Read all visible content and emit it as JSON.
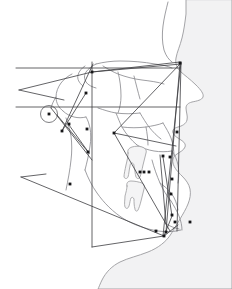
{
  "image": {
    "title": "Lateral Cephalometric Tracing",
    "description": "Cephalometric radiograph tracing of a lateral skull profile with superimposed analysis lines and landmark points",
    "width": 232,
    "height": 289,
    "background_color": "#ffffff"
  },
  "colors": {
    "background": "#ffffff",
    "soft_tissue_fill": "#f2f2f3",
    "soft_tissue_stroke": "#9b9b9e",
    "bone_stroke": "#8d8d91",
    "bone_fill": "#ededef",
    "tooth_fill": "#f4f4f5",
    "tooth_stroke": "#9a9a9d",
    "analysis_line": "#3c3c40",
    "landmark_dot": "#161618"
  },
  "structures": {
    "soft_tissue_profile": {
      "name": "soft-tissue-profile",
      "path": "M 186 0 L 186 14 C 185 22 184 30 182 38 C 180 46 177 52 176 58 C 175 64 177 68 180 71 C 184 75 190 79 196 85 C 201 90 204 94 203 97 C 202 100 197 101 192 102 C 188 103 186 105 186 108 C 186 112 188 116 187 120 C 186 124 182 126 178 127 C 174 128 172 130 173 133 C 174 136 178 138 181 140 C 184 142 186 144 185 147 C 184 150 180 152 177 154 C 174 156 172 159 173 163 C 174 168 178 172 182 176 C 186 180 189 184 190 189 C 191 194 190 199 188 204 C 186 209 183 214 180 219 C 177 224 174 229 171 234 C 166 242 158 248 148 252 C 138 256 128 258 120 262 C 112 266 106 272 102 280 C 100 284 99 287 98 289 L 232 289 L 232 0 Z"
    },
    "cranial_outline": {
      "name": "cranial-base-outline",
      "paths": [
        "M 168 2 C 166 10 164 18 163 26 C 162 34 162 42 164 50 C 166 56 169 60 172 62",
        "M 96 64 C 104 62 112 61 120 61 C 132 61 144 62 155 64 C 162 65 168 66 172 68",
        "M 96 64 C 92 66 88 69 86 72 C 84 75 84 79 86 82 C 88 85 92 87 96 88",
        "M 85 66 C 82 68 79 71 78 75 C 77 79 79 83 83 86",
        "M 103 66 C 108 69 113 72 118 74 C 126 77 134 79 142 80 C 150 81 158 82 164 84",
        "M 118 72 C 120 80 121 88 121 96 C 121 102 120 108 118 113",
        "M 134 76 C 136 84 138 92 140 99",
        "M 72 74 C 68 76 64 79 61 83 C 58 87 56 92 56 97 C 56 103 59 108 63 111",
        "M 63 111 C 66 114 70 116 74 117 C 78 118 82 118 86 117",
        "M 56 97 C 54 100 52 104 51 108",
        "M 86 117 C 88 120 89 124 90 128 C 91 134 91 140 90 146 C 89 154 87 162 85 170",
        "M 66 118 C 68 124 70 130 71 136 C 72 144 72 152 71 160 C 70 170 68 180 66 190",
        "M 98 108 C 104 110 110 112 116 113 C 124 114 132 114 140 113",
        "M 116 113 C 118 118 120 123 122 127 C 126 134 131 140 137 145",
        "M 140 113 C 143 118 146 123 149 127 C 153 132 157 136 161 139",
        "M 122 127 C 130 128 138 128 146 127 C 152 126 158 125 163 123",
        "M 137 145 C 142 148 148 150 154 151 C 160 152 166 152 172 151",
        "M 163 123 C 166 128 169 133 171 138 C 173 144 174 150 174 156",
        "M 172 151 C 175 155 177 160 178 165 C 179 171 179 177 178 183",
        "M 146 127 C 147 133 148 139 148 145",
        "M 85 170 C 88 178 92 186 97 193 C 104 203 113 212 124 219 C 134 225 146 229 158 231 C 166 232 174 232 181 230",
        "M 152 160 C 154 168 157 176 160 183 C 163 190 167 196 171 201",
        "M 160 183 C 164 186 168 189 171 193 C 175 198 177 204 178 210",
        "M 171 201 C 174 206 177 211 179 216 C 181 221 182 226 182 230",
        "M 166 224 C 170 226 174 228 179 229"
      ]
    },
    "teeth": [
      {
        "name": "upper-molar-tooth",
        "path": "M 128 153 C 127 150 129 148 132 147 C 135 146 139 146 142 147 C 145 148 147 150 146 153 C 145 157 144 161 143 165 C 142 170 141 174 140 177 C 139 179 137 179 136 177 C 135 174 135 170 134 166 C 134 164 133 163 132 163 C 131 163 130 164 130 166 C 129 170 129 174 128 177 C 127 179 125 179 124 177 C 124 174 125 170 126 165 C 127 161 128 157 128 153 Z"
      },
      {
        "name": "lower-molar-tooth",
        "path": "M 127 186 C 126 183 128 181 131 181 C 135 181 139 182 142 183 C 144 184 145 186 144 189 C 143 193 142 197 141 201 C 140 205 139 208 138 210 C 137 212 135 211 135 209 C 134 206 134 202 134 199 C 133 197 132 197 131 198 C 130 200 130 203 129 206 C 128 209 126 209 125 207 C 124 204 125 200 125 196 C 126 192 127 189 127 186 Z"
      }
    ],
    "sella_turcica": {
      "name": "sella-turcica-circle",
      "cx": 49,
      "cy": 114,
      "r": 8.5
    }
  },
  "analysis_lines": [
    {
      "name": "frankfort-horizontal-line",
      "points": "16,68 180,68"
    },
    {
      "name": "sella-nasion-line",
      "points": "16,107 180,107"
    },
    {
      "name": "upper-construction-line-a",
      "points": "19,90 92,72"
    },
    {
      "name": "upper-construction-line-b",
      "points": "19,90 64,100"
    },
    {
      "name": "nasion-point-ray-line",
      "points": "92,72 180,62"
    },
    {
      "name": "nasion-to-facial-plane",
      "points": "92,72 181,64"
    },
    {
      "name": "cranial-vertical-line",
      "points": "92,62 92,247"
    },
    {
      "name": "facial-plane-line",
      "points": "181,62 163,236"
    },
    {
      "name": "nasion-a-point-line",
      "points": "181,63 177,231"
    },
    {
      "name": "ptm-vertical-line",
      "points": "180,63 166,232"
    },
    {
      "name": "mandibular-plane-line",
      "points": "21,177 164,236"
    },
    {
      "name": "gonion-extension-line",
      "points": "21,177 46,174"
    },
    {
      "name": "ramus-line",
      "points": "69,125 89,153"
    },
    {
      "name": "condyle-to-gonion-line",
      "points": "93,64 62,131"
    },
    {
      "name": "sella-to-articulare-line",
      "points": "57,115 89,153"
    },
    {
      "name": "occlusal-plane-line",
      "points": "114,133 176,146"
    },
    {
      "name": "a-point-to-pogonion-line",
      "points": "114,133 170,231"
    },
    {
      "name": "palatal-plane-line",
      "points": "114,133 181,63"
    },
    {
      "name": "condyle-line",
      "points": "62,131 86,93"
    },
    {
      "name": "y-axis-line",
      "points": "51,108 92,160"
    },
    {
      "name": "upper-incisor-axis",
      "points": "163,157 172,216"
    },
    {
      "name": "lower-incisor-axis",
      "points": "160,155 166,224"
    },
    {
      "name": "mandibular-body-line",
      "points": "92,247 164,236"
    },
    {
      "name": "chin-construction-line",
      "points": "164,236 178,225"
    },
    {
      "name": "lower-face-line",
      "points": "164,236 172,216"
    }
  ],
  "landmarks": [
    {
      "name": "landmark-nasion",
      "x": 92,
      "y": 72
    },
    {
      "name": "landmark-sella",
      "x": 49,
      "y": 114
    },
    {
      "name": "landmark-porion",
      "x": 62,
      "y": 131
    },
    {
      "name": "landmark-orbitale",
      "x": 88,
      "y": 152
    },
    {
      "name": "landmark-articulare",
      "x": 87,
      "y": 129
    },
    {
      "name": "landmark-ptm",
      "x": 180,
      "y": 63
    },
    {
      "name": "landmark-a-point",
      "x": 114,
      "y": 133
    },
    {
      "name": "landmark-ans",
      "x": 177,
      "y": 132
    },
    {
      "name": "landmark-pns",
      "x": 163,
      "y": 156
    },
    {
      "name": "landmark-upper-incisor-tip",
      "x": 170,
      "y": 157
    },
    {
      "name": "landmark-upper-molar-mesial",
      "x": 140,
      "y": 172
    },
    {
      "name": "landmark-upper-molar-distal",
      "x": 149,
      "y": 172
    },
    {
      "name": "landmark-b-point",
      "x": 171,
      "y": 194
    },
    {
      "name": "landmark-lower-incisor-tip",
      "x": 172,
      "y": 179
    },
    {
      "name": "landmark-pogonion",
      "x": 172,
      "y": 215
    },
    {
      "name": "landmark-gnathion",
      "x": 175,
      "y": 222
    },
    {
      "name": "landmark-menton",
      "x": 166,
      "y": 232
    },
    {
      "name": "landmark-gonion",
      "x": 164,
      "y": 236
    },
    {
      "name": "landmark-go-construct",
      "x": 156,
      "y": 231
    },
    {
      "name": "landmark-soft-pogonion",
      "x": 190,
      "y": 222
    },
    {
      "name": "landmark-ramus-point",
      "x": 69,
      "y": 124
    },
    {
      "name": "landmark-mandibular-plane-point",
      "x": 70,
      "y": 184
    },
    {
      "name": "landmark-condylion",
      "x": 86,
      "y": 93
    },
    {
      "name": "landmark-occlusal-posterior",
      "x": 144,
      "y": 172
    }
  ]
}
